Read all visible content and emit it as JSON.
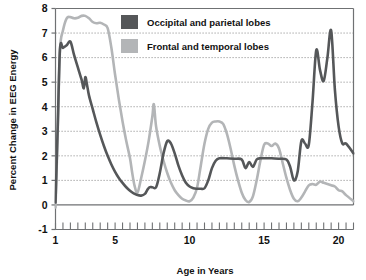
{
  "chart_data": {
    "type": "line",
    "title": "",
    "xlabel": "Age in Years",
    "ylabel": "Percent Change in EEG Energy",
    "xlim": [
      1,
      21
    ],
    "ylim": [
      -1,
      8
    ],
    "xticks": [
      1,
      5,
      10,
      15,
      20
    ],
    "xtick_labels": [
      "1",
      "5",
      "10",
      "15",
      "20"
    ],
    "xminor_step": 0.5,
    "yticks": [
      -1,
      0,
      1,
      2,
      3,
      4,
      5,
      6,
      7,
      8
    ],
    "ytick_labels": [
      "-1",
      "0",
      "1",
      "2",
      "3",
      "4",
      "5",
      "6",
      "7",
      "8"
    ],
    "grid": "horizontal-dotted",
    "legend_position": "top-center",
    "series": [
      {
        "name": "Occipital and parietal lobes",
        "color": "#555759",
        "x": [
          1.0,
          1.15,
          1.3,
          1.5,
          1.75,
          2.0,
          2.25,
          2.5,
          2.75,
          2.9,
          3.0,
          3.1,
          3.25,
          3.5,
          3.75,
          4.0,
          4.25,
          4.5,
          4.75,
          5.0,
          5.25,
          5.5,
          5.75,
          6.0,
          6.25,
          6.5,
          6.75,
          7.0,
          7.15,
          7.3,
          7.5,
          7.75,
          8.0,
          8.25,
          8.5,
          8.75,
          9.0,
          9.25,
          9.5,
          9.75,
          10.0,
          10.25,
          10.5,
          10.75,
          11.0,
          11.25,
          11.5,
          11.75,
          12.0,
          12.5,
          13.0,
          13.5,
          13.75,
          14.0,
          14.25,
          14.5,
          14.75,
          15.0,
          15.5,
          16.0,
          16.5,
          16.75,
          17.0,
          17.25,
          17.5,
          17.75,
          18.0,
          18.25,
          18.5,
          18.75,
          19.0,
          19.25,
          19.5,
          19.75,
          20.0,
          20.25,
          20.5,
          21.0
        ],
        "y": [
          0.1,
          3.2,
          6.35,
          6.4,
          6.5,
          6.65,
          6.1,
          5.6,
          5.1,
          4.75,
          5.2,
          4.95,
          4.45,
          3.9,
          3.35,
          2.85,
          2.4,
          2.0,
          1.65,
          1.35,
          1.1,
          0.9,
          0.72,
          0.58,
          0.47,
          0.4,
          0.38,
          0.45,
          0.6,
          0.72,
          0.72,
          0.72,
          1.3,
          2.1,
          2.6,
          2.5,
          2.1,
          1.6,
          1.2,
          0.9,
          0.75,
          0.68,
          0.66,
          0.66,
          0.68,
          1.0,
          1.5,
          1.8,
          1.9,
          1.9,
          1.88,
          1.85,
          1.5,
          1.75,
          1.55,
          1.85,
          1.9,
          1.9,
          1.9,
          1.88,
          1.85,
          1.55,
          1.0,
          1.35,
          2.6,
          2.5,
          2.45,
          4.2,
          6.3,
          5.5,
          5.05,
          6.0,
          7.1,
          4.7,
          3.2,
          2.5,
          2.5,
          2.1
        ]
      },
      {
        "name": "Frontal and temporal lobes",
        "color": "#b3b5b7",
        "x": [
          1.0,
          1.15,
          1.3,
          1.5,
          1.75,
          2.0,
          2.25,
          2.5,
          2.75,
          3.0,
          3.25,
          3.5,
          3.75,
          4.0,
          4.25,
          4.5,
          4.75,
          5.0,
          5.25,
          5.5,
          5.75,
          6.0,
          6.15,
          6.3,
          6.5,
          6.75,
          7.0,
          7.25,
          7.5,
          7.6,
          7.75,
          8.0,
          8.25,
          8.5,
          8.75,
          9.0,
          9.25,
          9.5,
          9.75,
          10.0,
          10.25,
          10.5,
          10.75,
          11.0,
          11.25,
          11.5,
          11.75,
          12.0,
          12.25,
          12.5,
          12.75,
          13.0,
          13.25,
          13.5,
          13.75,
          14.0,
          14.25,
          14.5,
          14.75,
          15.0,
          15.25,
          15.5,
          15.75,
          16.0,
          16.25,
          16.5,
          16.75,
          17.0,
          17.25,
          17.5,
          17.75,
          18.0,
          18.25,
          18.5,
          18.75,
          19.0,
          19.25,
          19.5,
          19.75,
          20.0,
          20.25,
          20.5,
          21.0
        ],
        "y": [
          -0.1,
          3.0,
          6.3,
          7.1,
          7.6,
          7.65,
          7.6,
          7.62,
          7.7,
          7.7,
          7.6,
          7.45,
          7.4,
          7.42,
          7.35,
          7.2,
          6.4,
          5.3,
          4.3,
          3.4,
          2.6,
          1.9,
          1.3,
          0.8,
          0.5,
          1.1,
          1.8,
          2.6,
          3.6,
          4.1,
          3.2,
          2.4,
          1.8,
          1.3,
          0.9,
          0.6,
          0.4,
          0.25,
          0.18,
          0.15,
          0.3,
          0.7,
          1.6,
          2.5,
          3.1,
          3.35,
          3.4,
          3.4,
          3.3,
          2.9,
          2.3,
          1.6,
          1.0,
          0.5,
          0.2,
          0.12,
          0.35,
          1.0,
          1.8,
          2.45,
          2.5,
          2.4,
          2.5,
          2.3,
          1.7,
          1.1,
          0.6,
          0.25,
          0.15,
          0.3,
          0.55,
          0.8,
          0.85,
          0.82,
          0.95,
          0.9,
          0.85,
          0.8,
          0.75,
          0.6,
          0.55,
          0.4,
          0.15
        ]
      }
    ],
    "legend": [
      {
        "label": "Occipital and parietal lobes",
        "color": "#555759"
      },
      {
        "label": "Frontal and temporal lobes",
        "color": "#b3b5b7"
      }
    ]
  }
}
